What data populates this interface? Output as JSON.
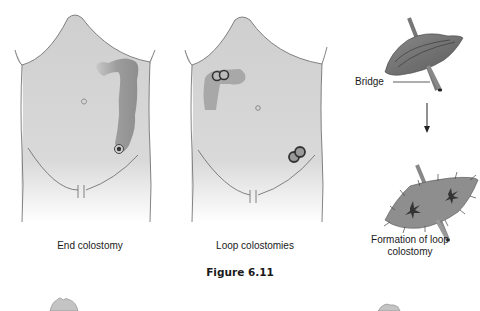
{
  "figure": {
    "title": "Figure 6.11",
    "panels": [
      {
        "id": "end-colostomy",
        "caption": "End colostomy"
      },
      {
        "id": "loop-colostomies",
        "caption": "Loop colostomies"
      },
      {
        "id": "formation-of-loop-colostomy",
        "caption_line1": "Formation of loop",
        "caption_line2": "colostomy"
      }
    ],
    "labels": {
      "bridge": "Bridge"
    }
  },
  "colors": {
    "skin": "#d6d6d6",
    "colon": "#9a9a9a",
    "outline": "#555555",
    "stoma": "#333333"
  }
}
